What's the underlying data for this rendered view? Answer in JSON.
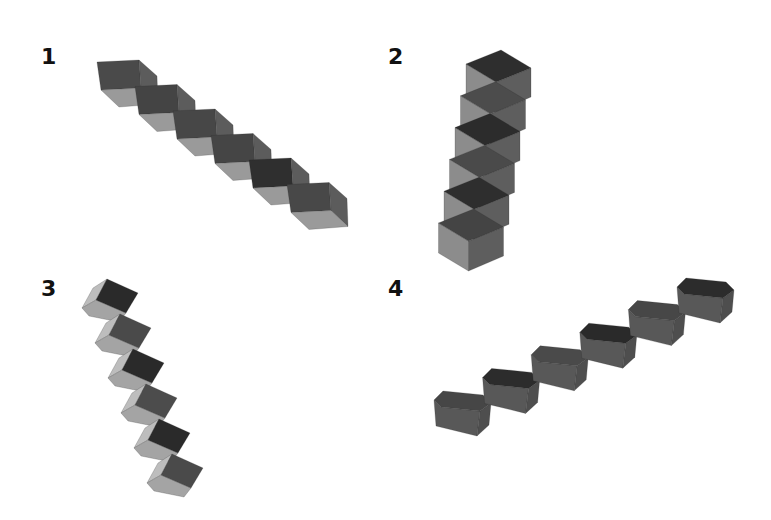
{
  "figure": {
    "panels": [
      {
        "label": "1",
        "label_pos": [
          41,
          46
        ],
        "arrangement": "diagonal-down-right",
        "cube_count": 6,
        "origin": [
          97,
          62
        ],
        "step": [
          38,
          24.5
        ],
        "shape": {
          "front": [
            [
              0,
              0
            ],
            [
              42,
              -2
            ],
            [
              44,
              26
            ],
            [
              4,
              28
            ]
          ],
          "right": [
            [
              42,
              -2
            ],
            [
              60,
              14
            ],
            [
              61,
              42
            ],
            [
              44,
              26
            ]
          ],
          "bottom": [
            [
              4,
              28
            ],
            [
              44,
              26
            ],
            [
              61,
              42
            ],
            [
              22,
              45
            ]
          ]
        },
        "face_colors": {
          "front": [
            "#4a4a4a",
            "#444444",
            "#474747",
            "#454545",
            "#2f2f2f",
            "#484848"
          ],
          "right": "#5c5c5c",
          "bottom": "#9a9a9a"
        }
      },
      {
        "label": "2",
        "label_pos": [
          388,
          46
        ],
        "arrangement": "vertical-stack",
        "cube_count": 6,
        "origin": [
          466,
          64
        ],
        "step": [
          -5.5,
          31.8
        ],
        "shape": {
          "left": [
            [
              0,
              0
            ],
            [
              30,
              18
            ],
            [
              30,
              48
            ],
            [
              0,
              30
            ]
          ],
          "right": [
            [
              30,
              18
            ],
            [
              65,
              4
            ],
            [
              65,
              33
            ],
            [
              30,
              48
            ]
          ],
          "top": [
            [
              0,
              0
            ],
            [
              35,
              -14
            ],
            [
              65,
              4
            ],
            [
              30,
              18
            ]
          ]
        },
        "face_colors": {
          "top": [
            "#2e2e2e",
            "#4c4c4c",
            "#2c2c2c",
            "#4a4a4a",
            "#2e2e2e",
            "#444444"
          ],
          "left": "#8c8c8c",
          "right": "#5e5e5e"
        }
      },
      {
        "label": "3",
        "label_pos": [
          41,
          278
        ],
        "arrangement": "staircase-down-right",
        "cube_count": 6,
        "origin": [
          96,
          300
        ],
        "step": [
          13,
          35
        ],
        "shape": {
          "top": [
            [
              11,
              -21
            ],
            [
              42,
              -7
            ],
            [
              30,
              13
            ],
            [
              0,
              0
            ]
          ],
          "light": [
            [
              -14,
              8
            ],
            [
              0,
              0
            ],
            [
              30,
              13
            ],
            [
              23,
              22
            ],
            [
              -7,
              16
            ]
          ],
          "edge": [
            [
              -14,
              8
            ],
            [
              -3,
              -12
            ],
            [
              11,
              -21
            ],
            [
              0,
              0
            ]
          ]
        },
        "face_colors": {
          "top": [
            "#2a2a2a",
            "#4a4a4a",
            "#2a2a2a",
            "#4c4c4c",
            "#2a2a2a",
            "#4a4a4a"
          ],
          "light": "#a4a4a4",
          "edge": "#bdbdbd"
        }
      },
      {
        "label": "4",
        "label_pos": [
          388,
          278
        ],
        "arrangement": "staircase-up-right",
        "cube_count": 6,
        "origin": [
          443,
          391
        ],
        "step": [
          48.6,
          -22.6
        ],
        "shape": {
          "top": [
            [
              0,
              0
            ],
            [
              40,
              4
            ],
            [
              48,
              12
            ],
            [
              37,
              20
            ],
            [
              -2,
              16
            ],
            [
              -9,
              9
            ]
          ],
          "front": [
            [
              -9,
              9
            ],
            [
              -2,
              16
            ],
            [
              37,
              20
            ],
            [
              34,
              45
            ],
            [
              -7,
              35
            ]
          ],
          "side": [
            [
              37,
              20
            ],
            [
              48,
              12
            ],
            [
              46,
              34
            ],
            [
              34,
              45
            ]
          ]
        },
        "face_colors": {
          "top": [
            "#464646",
            "#2c2c2c",
            "#4a4a4a",
            "#2a2a2a",
            "#474747",
            "#2c2c2c"
          ],
          "front": "#585858",
          "side": "#4e4e4e"
        }
      }
    ]
  }
}
